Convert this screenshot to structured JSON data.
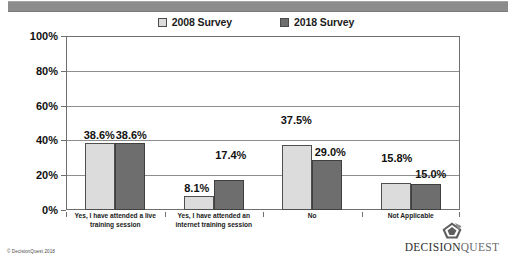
{
  "slide": {
    "banner_present": true,
    "copyright": "© DecisionQuest 2018",
    "brand": {
      "mark_icon": "diamond-arrow-logo-icon",
      "name_part1": "DECISION",
      "name_part2": "QUEST"
    }
  },
  "chart_data": {
    "type": "bar",
    "title": "",
    "xlabel": "",
    "ylabel": "",
    "ylim": [
      0,
      100
    ],
    "yticks": [
      "0%",
      "20%",
      "40%",
      "60%",
      "80%",
      "100%"
    ],
    "ytick_values": [
      0,
      20,
      40,
      60,
      80,
      100
    ],
    "grid": true,
    "legend_position": "top-center",
    "categories": [
      "Yes, I have attended a live training session",
      "Yes, I have attended an internet training session",
      "No",
      "Not Applicable"
    ],
    "series": [
      {
        "name": "2008 Survey",
        "color": "#dcdcdc",
        "values": [
          38.6,
          8.1,
          37.5,
          15.8
        ],
        "labels": [
          "38.6%",
          "8.1%",
          "37.5%",
          "15.8%"
        ]
      },
      {
        "name": "2018 Survey",
        "color": "#6e6e6e",
        "values": [
          38.6,
          17.4,
          29.0,
          15.0
        ],
        "labels": [
          "38.6%",
          "17.4%",
          "29.0%",
          "15.0%"
        ]
      }
    ]
  }
}
